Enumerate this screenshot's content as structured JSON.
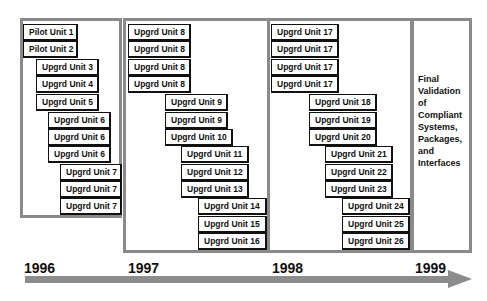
{
  "diagram": {
    "panels": [
      {
        "year": "1996",
        "units": [
          {
            "label": "Pilot Unit 1",
            "x": 23,
            "y": 24,
            "w": 55
          },
          {
            "label": "Pilot Unit 2",
            "x": 23,
            "y": 41,
            "w": 55
          },
          {
            "label": "Upgrd Unit 3",
            "x": 36,
            "y": 59,
            "w": 63
          },
          {
            "label": "Upgrd Unit 4",
            "x": 36,
            "y": 76,
            "w": 63
          },
          {
            "label": "Upgrd Unit 5",
            "x": 36,
            "y": 94,
            "w": 63
          },
          {
            "label": "Upgrd Unit 6",
            "x": 48,
            "y": 112,
            "w": 63
          },
          {
            "label": "Upgrd Unit 6",
            "x": 48,
            "y": 129,
            "w": 63
          },
          {
            "label": "Upgrd Unit 6",
            "x": 48,
            "y": 146,
            "w": 63
          },
          {
            "label": "Upgrd Unit 7",
            "x": 60,
            "y": 164,
            "w": 62
          },
          {
            "label": "Upgrd Unit 7",
            "x": 60,
            "y": 181,
            "w": 62
          },
          {
            "label": "Upgrd Unit 7",
            "x": 60,
            "y": 198,
            "w": 62
          }
        ]
      },
      {
        "year": "1997",
        "units": [
          {
            "label": "Upgrd Unit 8",
            "x": 128,
            "y": 24,
            "w": 63
          },
          {
            "label": "Upgrd Unit 8",
            "x": 128,
            "y": 41,
            "w": 63
          },
          {
            "label": "Upgrd Unit 8",
            "x": 128,
            "y": 59,
            "w": 63
          },
          {
            "label": "Upgrd Unit 8",
            "x": 128,
            "y": 76,
            "w": 63
          },
          {
            "label": "Upgrd Unit 9",
            "x": 165,
            "y": 94,
            "w": 63
          },
          {
            "label": "Upgrd Unit 9",
            "x": 165,
            "y": 112,
            "w": 63
          },
          {
            "label": "Upgrd Unit 10",
            "x": 165,
            "y": 129,
            "w": 68
          },
          {
            "label": "Upgrd Unit 11",
            "x": 181,
            "y": 146,
            "w": 68
          },
          {
            "label": "Upgrd Unit 12",
            "x": 181,
            "y": 164,
            "w": 68
          },
          {
            "label": "Upgrd Unit 13",
            "x": 181,
            "y": 181,
            "w": 68
          },
          {
            "label": "Upgrd Unit 14",
            "x": 198,
            "y": 198,
            "w": 69
          },
          {
            "label": "Upgrd Unit 15",
            "x": 198,
            "y": 216,
            "w": 69
          },
          {
            "label": "Upgrd Unit 16",
            "x": 198,
            "y": 233,
            "w": 69
          }
        ]
      },
      {
        "year": "1998",
        "units": [
          {
            "label": "Upgrd Unit 17",
            "x": 271,
            "y": 24,
            "w": 68
          },
          {
            "label": "Upgrd Unit 17",
            "x": 271,
            "y": 41,
            "w": 68
          },
          {
            "label": "Upgrd Unit 17",
            "x": 271,
            "y": 59,
            "w": 68
          },
          {
            "label": "Upgrd Unit 17",
            "x": 271,
            "y": 76,
            "w": 68
          },
          {
            "label": "Upgrd Unit 18",
            "x": 309,
            "y": 94,
            "w": 68
          },
          {
            "label": "Upgrd Unit 19",
            "x": 309,
            "y": 112,
            "w": 68
          },
          {
            "label": "Upgrd Unit 20",
            "x": 309,
            "y": 129,
            "w": 68
          },
          {
            "label": "Upgrd Unit 21",
            "x": 325,
            "y": 146,
            "w": 68
          },
          {
            "label": "Upgrd Unit 22",
            "x": 325,
            "y": 164,
            "w": 68
          },
          {
            "label": "Upgrd Unit 23",
            "x": 325,
            "y": 181,
            "w": 68
          },
          {
            "label": "Upgrd Unit 24",
            "x": 342,
            "y": 198,
            "w": 68
          },
          {
            "label": "Upgrd Unit 25",
            "x": 342,
            "y": 216,
            "w": 68
          },
          {
            "label": "Upgrd Unit 26",
            "x": 342,
            "y": 233,
            "w": 68
          }
        ]
      },
      {
        "year": "1999",
        "final_text": [
          "Final",
          "Validation",
          "of",
          "Compliant",
          "Systems,",
          "Packages,",
          "and",
          "Interfaces"
        ]
      }
    ],
    "colors": {
      "panel_border": "#8a8a8a",
      "arrow": "#8c8c8c",
      "text": "#111111"
    }
  }
}
